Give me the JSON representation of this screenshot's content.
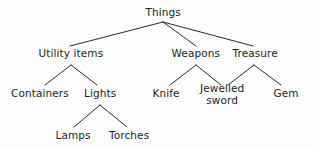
{
  "diagram": {
    "type": "tree",
    "background_color": "#fefefe",
    "line_color": "#2b2828",
    "text_color": "#211f1f",
    "nodes": [
      {
        "id": "things",
        "label": "Things",
        "level": 0,
        "cx": 163,
        "cy": 13
      },
      {
        "id": "utility",
        "label": "Utility items",
        "level": 1,
        "cx": 71,
        "cy": 54
      },
      {
        "id": "weapons",
        "label": "Weapons",
        "level": 1,
        "cx": 196,
        "cy": 54
      },
      {
        "id": "treasure",
        "label": "Treasure",
        "level": 1,
        "cx": 255,
        "cy": 54
      },
      {
        "id": "containers",
        "label": "Containers",
        "level": 2,
        "cx": 40,
        "cy": 94
      },
      {
        "id": "lights",
        "label": "Lights",
        "level": 2,
        "cx": 100,
        "cy": 94
      },
      {
        "id": "knife",
        "label": "Knife",
        "level": 2,
        "cx": 166,
        "cy": 94
      },
      {
        "id": "jewelled",
        "label": "Jewelled\nsword",
        "level": 2,
        "cx": 222,
        "cy": 94
      },
      {
        "id": "gem",
        "label": "Gem",
        "level": 2,
        "cx": 286,
        "cy": 94
      },
      {
        "id": "lamps",
        "label": "Lamps",
        "level": 3,
        "cx": 73,
        "cy": 136
      },
      {
        "id": "torches",
        "label": "Torches",
        "level": 3,
        "cx": 129,
        "cy": 136
      }
    ],
    "edges": [
      {
        "from": "things",
        "to": "utility",
        "x1": 163,
        "y1": 22,
        "x2": 70,
        "y2": 46
      },
      {
        "from": "things",
        "to": "weapons",
        "x1": 163,
        "y1": 22,
        "x2": 196,
        "y2": 46
      },
      {
        "from": "things",
        "to": "treasure",
        "x1": 163,
        "y1": 22,
        "x2": 253,
        "y2": 46
      },
      {
        "from": "utility",
        "to": "containers",
        "x1": 71,
        "y1": 65,
        "x2": 45,
        "y2": 85
      },
      {
        "from": "utility",
        "to": "lights",
        "x1": 71,
        "y1": 65,
        "x2": 97,
        "y2": 85
      },
      {
        "from": "weapons",
        "to": "knife",
        "x1": 196,
        "y1": 65,
        "x2": 170,
        "y2": 85
      },
      {
        "from": "weapons",
        "to": "jewelled",
        "x1": 196,
        "y1": 65,
        "x2": 221,
        "y2": 85
      },
      {
        "from": "treasure",
        "to": "jewelled",
        "x1": 254,
        "y1": 65,
        "x2": 228,
        "y2": 85
      },
      {
        "from": "treasure",
        "to": "gem",
        "x1": 254,
        "y1": 65,
        "x2": 281,
        "y2": 85
      },
      {
        "from": "lights",
        "to": "lamps",
        "x1": 100,
        "y1": 105,
        "x2": 74,
        "y2": 127
      },
      {
        "from": "lights",
        "to": "torches",
        "x1": 100,
        "y1": 105,
        "x2": 127,
        "y2": 127
      }
    ]
  }
}
